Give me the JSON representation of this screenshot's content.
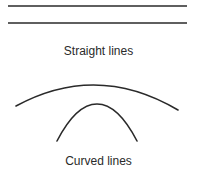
{
  "diagram": {
    "straight_section": {
      "caption": "Straight lines",
      "lines": [
        {
          "x1": 8,
          "y1": 6,
          "x2": 187,
          "y2": 6
        },
        {
          "x1": 8,
          "y1": 23,
          "x2": 187,
          "y2": 23
        }
      ]
    },
    "curved_section": {
      "caption": "Curved lines",
      "curves": [
        {
          "name": "wide-arc",
          "start": [
            16,
            106
          ],
          "peak": [
            97,
            83
          ],
          "end": [
            178,
            110
          ]
        },
        {
          "name": "narrow-arch",
          "start": [
            57,
            141
          ],
          "peak": [
            97,
            104
          ],
          "end": [
            137,
            141
          ]
        }
      ]
    },
    "stroke_color": "#2a2a2a"
  }
}
